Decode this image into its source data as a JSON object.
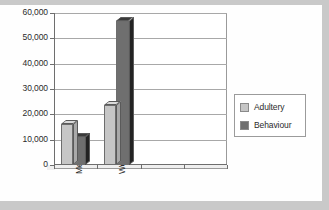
{
  "chart_data": {
    "type": "bar",
    "title": "",
    "subtitle": "",
    "xlabel": "",
    "ylabel": "",
    "categories": [
      "Men",
      "Women",
      "",
      ""
    ],
    "series": [
      {
        "name": "Adultery",
        "values": [
          16000,
          23500,
          null,
          null
        ],
        "color": "#c6c6c6"
      },
      {
        "name": "Behaviour",
        "values": [
          11000,
          57000,
          null,
          null
        ],
        "color": "#6f6f6f"
      }
    ],
    "ylim": [
      0,
      60000
    ],
    "y_ticks": [
      0,
      10000,
      20000,
      30000,
      40000,
      50000,
      60000
    ],
    "y_tick_labels": [
      "0",
      "10,000",
      "20,000",
      "30,000",
      "40,000",
      "50,000",
      "60,000"
    ],
    "grid": true,
    "grid_axis": "y",
    "legend": true,
    "legend_position": "right",
    "style_3d": true
  },
  "legend": {
    "entries": [
      {
        "label": "Adultery"
      },
      {
        "label": "Behaviour"
      }
    ]
  },
  "axis": {
    "y_labels": [
      "60,000",
      "50,000",
      "40,000",
      "30,000",
      "20,000",
      "10,000",
      "0"
    ],
    "x_labels": [
      "Men",
      "Women"
    ]
  }
}
